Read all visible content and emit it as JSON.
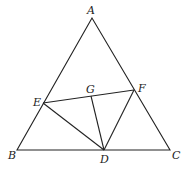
{
  "diagram": {
    "type": "geometry",
    "points": {
      "A": {
        "label": "A",
        "x": 92,
        "y": 18
      },
      "B": {
        "label": "B",
        "x": 17,
        "y": 150
      },
      "C": {
        "label": "C",
        "x": 170,
        "y": 150
      },
      "D": {
        "label": "D",
        "x": 104,
        "y": 150
      },
      "E": {
        "label": "E",
        "x": 43,
        "y": 103
      },
      "F": {
        "label": "F",
        "x": 134,
        "y": 90
      },
      "G": {
        "label": "G",
        "x": 91,
        "y": 96
      }
    },
    "segments": [
      "AB",
      "AC",
      "BC",
      "EF",
      "ED",
      "GD",
      "FD"
    ]
  }
}
